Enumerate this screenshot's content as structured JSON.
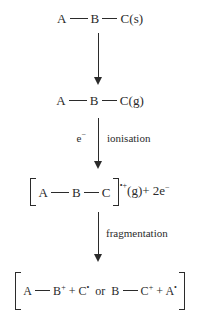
{
  "diagram": {
    "title": "Ionisation and fragmentation scheme",
    "background_color": "#ffffff",
    "text_color": "#2b2b2b",
    "stages": [
      {
        "id": "solid-molecule",
        "atom_a": "A",
        "atom_b": "B",
        "atom_c": "C",
        "state": "(s)"
      },
      {
        "id": "gaseous-molecule",
        "atom_a": "A",
        "atom_b": "B",
        "atom_c": "C",
        "state": "(g)"
      },
      {
        "id": "molecular-ion",
        "bracket_open": "[",
        "atom_a": "A",
        "atom_b": "B",
        "atom_c": "C",
        "bracket_close": "]",
        "charge_radical": "•",
        "charge_sign": "+",
        "state": "(g)",
        "electrons": "+ 2e",
        "electrons_sup": "−"
      },
      {
        "id": "fragments",
        "bracket_open": "[",
        "bracket_close": "]",
        "left_atom_a": "A",
        "left_atom_b": "B",
        "left_charge": "+",
        "left_plus": "+ C",
        "left_radical": "•",
        "conjunction": "or",
        "right_atom_b": "B",
        "right_atom_c": "C",
        "right_charge": "+",
        "right_plus": "+ A",
        "right_radical": "•"
      }
    ],
    "arrows": [
      {
        "id": "vaporisation-arrow",
        "label_left": "",
        "label_right": ""
      },
      {
        "id": "ionisation-arrow",
        "label_left": "e",
        "label_left_sup": "−",
        "label_right": "ionisation"
      },
      {
        "id": "fragmentation-arrow",
        "label_left": "",
        "label_right": "fragmentation"
      }
    ]
  }
}
